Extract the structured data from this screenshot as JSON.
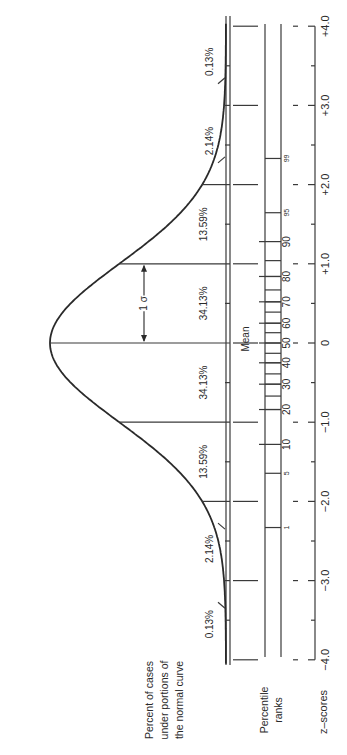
{
  "diagram": {
    "rotation_deg": 90,
    "labels": {
      "percent_cases": [
        "Percent of cases",
        "under portions of",
        "the normal curve"
      ],
      "percentile_ranks": [
        "Percentile",
        "ranks"
      ],
      "z_scores": "z–scores",
      "mean": "Mean",
      "sigma": "1 σ"
    },
    "segments": [
      {
        "from": -4,
        "to": -3,
        "percent": "0.13%"
      },
      {
        "from": -3,
        "to": -2,
        "percent": "2.14%"
      },
      {
        "from": -2,
        "to": -1,
        "percent": "13.59%"
      },
      {
        "from": -1,
        "to": 0,
        "percent": "34.13%"
      },
      {
        "from": 0,
        "to": 1,
        "percent": "34.13%"
      },
      {
        "from": 1,
        "to": 2,
        "percent": "13.59%"
      },
      {
        "from": 2,
        "to": 3,
        "percent": "2.14%"
      },
      {
        "from": 3,
        "to": 4,
        "percent": "0.13%"
      }
    ],
    "z_scores": [
      {
        "z": -4,
        "label": "−4.0"
      },
      {
        "z": -3,
        "label": "−3.0"
      },
      {
        "z": -2,
        "label": "−2.0"
      },
      {
        "z": -1,
        "label": "−1.0"
      },
      {
        "z": 0,
        "label": "0"
      },
      {
        "z": 1,
        "label": "+1.0"
      },
      {
        "z": 2,
        "label": "+2.0"
      },
      {
        "z": 3,
        "label": "+3.0"
      },
      {
        "z": 4,
        "label": "+4.0"
      }
    ],
    "percentile_ranks": [
      {
        "p": 1,
        "label": "1",
        "z": -2.33,
        "small": true
      },
      {
        "p": 5,
        "label": "5",
        "z": -1.645,
        "small": true
      },
      {
        "p": 10,
        "label": "10",
        "z": -1.28
      },
      {
        "p": 20,
        "label": "20",
        "z": -0.84
      },
      {
        "p": 30,
        "label": "30",
        "z": -0.52
      },
      {
        "p": 40,
        "label": "40",
        "z": -0.25
      },
      {
        "p": 50,
        "label": "50",
        "z": 0
      },
      {
        "p": 60,
        "label": "60",
        "z": 0.25
      },
      {
        "p": 70,
        "label": "70",
        "z": 0.52
      },
      {
        "p": 80,
        "label": "80",
        "z": 0.84
      },
      {
        "p": 90,
        "label": "90",
        "z": 1.28
      },
      {
        "p": 95,
        "label": "95",
        "z": 1.645,
        "small": true
      },
      {
        "p": 99,
        "label": "99",
        "z": 2.33,
        "small": true
      }
    ],
    "colors": {
      "ink": "#2a2a2a",
      "background": "#ffffff"
    }
  }
}
